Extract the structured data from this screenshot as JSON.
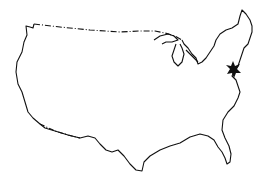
{
  "map": {
    "region": "Contiguous United States outline",
    "marker": {
      "shape": "six-pointed star",
      "location": "Mid-Atlantic coast (approx. Philadelphia / New Jersey)",
      "color": "#111111"
    },
    "outline_color": "#111111",
    "background": "#ffffff"
  }
}
